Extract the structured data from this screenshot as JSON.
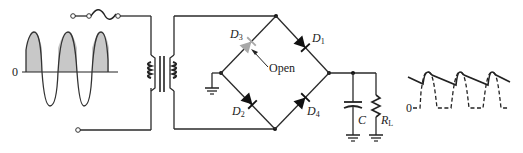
{
  "diagram": {
    "type": "bridge-rectifier-circuit",
    "input_waveform": {
      "zero_label": "0",
      "description": "sine wave with positive half-cycles shaded",
      "cycles": 3,
      "shade_color": "#c8c8c8"
    },
    "components": {
      "fuse": {
        "label": ""
      },
      "transformer": {
        "label": ""
      },
      "diodes": [
        {
          "id": "D3",
          "label": "D",
          "subscript": "3",
          "state": "open",
          "color": "#a8a8a8"
        },
        {
          "id": "D1",
          "label": "D",
          "subscript": "1",
          "state": "normal",
          "color": "#222222"
        },
        {
          "id": "D2",
          "label": "D",
          "subscript": "2",
          "state": "normal",
          "color": "#222222"
        },
        {
          "id": "D4",
          "label": "D",
          "subscript": "4",
          "state": "normal",
          "color": "#222222"
        }
      ],
      "open_annotation": "Open",
      "capacitor": {
        "label": "C"
      },
      "resistor": {
        "label": "R",
        "subscript": "L"
      }
    },
    "output_waveform": {
      "zero_label": "0",
      "description": "half-wave rectified (dashed) with capacitor-filtered ripple (solid)",
      "peaks": 3
    }
  }
}
